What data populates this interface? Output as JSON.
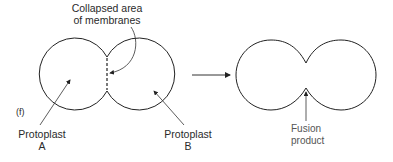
{
  "figure": {
    "panel_label": "(f)",
    "annotation_collapsed": [
      "Collapsed area",
      "of membranes"
    ],
    "protoplast_a": [
      "Protoplast",
      "A"
    ],
    "protoplast_b": [
      "Protoplast",
      "B"
    ],
    "fusion_product": [
      "Fusion",
      "product"
    ]
  },
  "colors": {
    "stroke": "#222222",
    "text": "#2a2a2a",
    "text_secondary": "#555555",
    "background": "#ffffff"
  }
}
